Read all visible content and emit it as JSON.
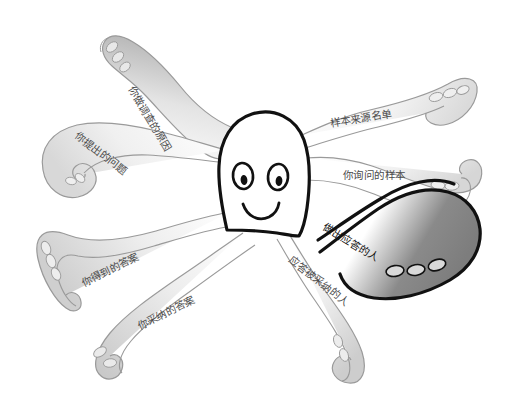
{
  "diagram": {
    "type": "octopus-concept-diagram",
    "background_color": "#ffffff",
    "body_outline_color": "#111111",
    "faint_tentacle_color": "#9a9a9a",
    "highlight_tentacle_color": "#111111",
    "highlight_tentacle_fill": "#808080",
    "label_color": "#2b2b2b",
    "tentacle_count": 8
  },
  "creature": {
    "head_name": "octopus-head",
    "left_eye_name": "left-eye",
    "right_eye_name": "right-eye",
    "mouth_name": "smiling-mouth"
  },
  "labels": [
    {
      "id": "reason-for-survey",
      "text": "你做调查的原因",
      "rotation": 59,
      "x": 131,
      "y": 82,
      "emphasis": "faint"
    },
    {
      "id": "questions-you-asked",
      "text": "你提出的问题",
      "rotation": 37,
      "x": 76,
      "y": 129,
      "emphasis": "faint"
    },
    {
      "id": "sample-source-list",
      "text": "样本来源名单",
      "rotation": -9,
      "x": 330,
      "y": 118,
      "emphasis": "faint"
    },
    {
      "id": "sample-you-queried",
      "text": "你询问的样本",
      "rotation": 0,
      "x": 343,
      "y": 170,
      "emphasis": "faint"
    },
    {
      "id": "people-who-responded",
      "text": "做出应答的人",
      "rotation": 31,
      "x": 324,
      "y": 221,
      "emphasis": "dark"
    },
    {
      "id": "responses-adopted",
      "text": "应答被采纳的人",
      "rotation": 38,
      "x": 290,
      "y": 253,
      "emphasis": "faint"
    },
    {
      "id": "answers-you-received",
      "text": "你得到的答案",
      "rotation": -26,
      "x": 82,
      "y": 278,
      "emphasis": "faint"
    },
    {
      "id": "answers-you-adopted",
      "text": "你采纳的答案",
      "rotation": -26,
      "x": 138,
      "y": 321,
      "emphasis": "faint"
    }
  ]
}
